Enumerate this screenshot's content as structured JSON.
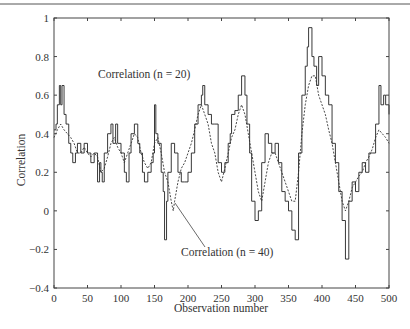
{
  "chart_data": {
    "type": "line",
    "title": "",
    "xlabel": "Observation number",
    "ylabel": "Correlation",
    "xlim": [
      0,
      500
    ],
    "ylim": [
      -0.4,
      1
    ],
    "x_ticks": [
      0,
      50,
      100,
      150,
      200,
      250,
      300,
      350,
      400,
      450,
      500
    ],
    "y_ticks": [
      -0.4,
      -0.2,
      0,
      0.2,
      0.4,
      0.6,
      0.8,
      1
    ],
    "y_tick_labels": [
      "−0.4",
      "−0.2",
      "0",
      "0.2",
      "0.4",
      "0.6",
      "0.8",
      "1"
    ],
    "grid": false,
    "legend": null,
    "annotations": [
      {
        "text": "Correlation (n = 20)",
        "series": "Correlation (n = 20)"
      },
      {
        "text": "Correlation (n = 40)",
        "series": "Correlation (n = 40)"
      }
    ],
    "series": [
      {
        "name": "Correlation (n = 20)",
        "style": "solid-step",
        "x": [
          0,
          3,
          5,
          8,
          10,
          12,
          15,
          18,
          22,
          25,
          28,
          32,
          35,
          40,
          45,
          50,
          55,
          60,
          65,
          68,
          70,
          72,
          75,
          80,
          85,
          88,
          92,
          95,
          100,
          105,
          108,
          112,
          115,
          120,
          125,
          128,
          132,
          135,
          140,
          145,
          148,
          150,
          152,
          155,
          160,
          163,
          165,
          168,
          170,
          175,
          180,
          185,
          190,
          195,
          200,
          205,
          210,
          215,
          220,
          222,
          225,
          230,
          235,
          240,
          245,
          250,
          255,
          260,
          263,
          265,
          270,
          275,
          280,
          285,
          288,
          292,
          295,
          300,
          305,
          310,
          315,
          320,
          325,
          330,
          335,
          340,
          345,
          350,
          355,
          360,
          365,
          370,
          375,
          378,
          380,
          385,
          388,
          392,
          395,
          400,
          405,
          410,
          415,
          420,
          425,
          430,
          435,
          440,
          445,
          450,
          455,
          460,
          465,
          470,
          475,
          480,
          485,
          488,
          492,
          495,
          500
        ],
        "values": [
          0.42,
          0.45,
          0.55,
          0.65,
          0.55,
          0.65,
          0.5,
          0.45,
          0.35,
          0.3,
          0.25,
          0.3,
          0.35,
          0.3,
          0.35,
          0.3,
          0.25,
          0.3,
          0.15,
          0.25,
          0.2,
          0.15,
          0.3,
          0.4,
          0.45,
          0.35,
          0.45,
          0.35,
          0.3,
          0.2,
          0.15,
          0.3,
          0.4,
          0.45,
          0.35,
          0.3,
          0.2,
          0.15,
          0.2,
          0.25,
          0.3,
          0.55,
          0.4,
          0.35,
          0.2,
          0.1,
          -0.15,
          0.05,
          0.2,
          0.35,
          0.3,
          0.2,
          0.15,
          0.15,
          0.2,
          0.3,
          0.45,
          0.55,
          0.6,
          0.65,
          0.55,
          0.5,
          0.45,
          0.45,
          0.25,
          0.2,
          0.25,
          0.35,
          0.4,
          0.5,
          0.52,
          0.6,
          0.7,
          0.6,
          0.45,
          0.3,
          0.05,
          -0.05,
          0.0,
          0.25,
          0.4,
          0.35,
          0.3,
          0.35,
          0.25,
          0.1,
          0.05,
          0.0,
          -0.1,
          -0.15,
          0.3,
          0.6,
          0.75,
          0.85,
          0.95,
          0.8,
          0.75,
          0.65,
          0.8,
          0.7,
          0.6,
          0.55,
          0.35,
          0.25,
          0.1,
          -0.05,
          -0.25,
          0.05,
          0.15,
          0.1,
          0.2,
          0.25,
          0.2,
          0.3,
          0.3,
          0.45,
          0.65,
          0.55,
          0.6,
          0.55,
          0.5
        ]
      },
      {
        "name": "Correlation (n = 40)",
        "style": "dashed",
        "x": [
          0,
          5,
          10,
          15,
          20,
          25,
          30,
          35,
          40,
          45,
          50,
          55,
          60,
          65,
          70,
          75,
          80,
          85,
          90,
          95,
          100,
          105,
          110,
          115,
          120,
          125,
          130,
          135,
          140,
          145,
          150,
          155,
          160,
          165,
          170,
          175,
          178,
          180,
          185,
          190,
          195,
          200,
          205,
          210,
          215,
          220,
          225,
          230,
          235,
          240,
          245,
          250,
          255,
          260,
          265,
          270,
          275,
          280,
          285,
          290,
          295,
          300,
          305,
          310,
          315,
          320,
          325,
          330,
          335,
          340,
          345,
          350,
          355,
          360,
          365,
          370,
          375,
          380,
          385,
          390,
          395,
          400,
          405,
          410,
          415,
          420,
          425,
          430,
          435,
          440,
          445,
          450,
          455,
          460,
          465,
          470,
          475,
          480,
          485,
          490,
          495,
          500
        ],
        "values": [
          0.38,
          0.42,
          0.45,
          0.42,
          0.4,
          0.38,
          0.35,
          0.3,
          0.3,
          0.33,
          0.3,
          0.28,
          0.3,
          0.28,
          0.2,
          0.22,
          0.28,
          0.35,
          0.38,
          0.33,
          0.3,
          0.25,
          0.3,
          0.35,
          0.4,
          0.38,
          0.3,
          0.25,
          0.22,
          0.25,
          0.35,
          0.38,
          0.3,
          0.2,
          0.15,
          0.05,
          0.0,
          0.05,
          0.15,
          0.22,
          0.25,
          0.3,
          0.35,
          0.42,
          0.5,
          0.55,
          0.5,
          0.45,
          0.35,
          0.3,
          0.2,
          0.15,
          0.22,
          0.3,
          0.38,
          0.42,
          0.5,
          0.55,
          0.5,
          0.4,
          0.3,
          0.2,
          0.1,
          0.05,
          0.15,
          0.25,
          0.3,
          0.3,
          0.25,
          0.2,
          0.15,
          0.1,
          0.05,
          0.05,
          0.2,
          0.4,
          0.55,
          0.65,
          0.7,
          0.7,
          0.6,
          0.55,
          0.5,
          0.42,
          0.35,
          0.25,
          0.15,
          0.05,
          0.0,
          0.05,
          0.12,
          0.15,
          0.18,
          0.2,
          0.25,
          0.28,
          0.32,
          0.38,
          0.42,
          0.4,
          0.38,
          0.35
        ]
      }
    ]
  }
}
